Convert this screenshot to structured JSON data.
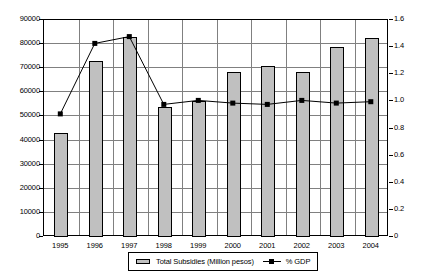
{
  "chart_data": {
    "type": "bar",
    "title": "",
    "subtitle": "",
    "xlabel": "",
    "ylabel": "",
    "categories": [
      "1995",
      "1996",
      "1997",
      "1998",
      "1999",
      "2000",
      "2001",
      "2002",
      "2003",
      "2004"
    ],
    "series": [
      {
        "name": "Total Subsidies (Million pesos)",
        "type": "bar",
        "axis": "left",
        "color": "#c0c0c0",
        "values": [
          43000,
          73000,
          83000,
          54000,
          56500,
          68500,
          71000,
          68500,
          79000,
          82500
        ]
      },
      {
        "name": "% GDP",
        "type": "line",
        "axis": "right",
        "color": "#000000",
        "values": [
          0.9,
          1.42,
          1.47,
          0.97,
          1.0,
          0.98,
          0.97,
          1.0,
          0.98,
          0.99
        ]
      }
    ],
    "left_axis": {
      "min": 0,
      "max": 90000,
      "step": 10000,
      "ticks": [
        "0",
        "10000",
        "20000",
        "30000",
        "40000",
        "50000",
        "60000",
        "70000",
        "80000",
        "90000"
      ]
    },
    "right_axis": {
      "min": 0,
      "max": 1.6,
      "step": 0.2,
      "ticks": [
        "0",
        "0.2",
        "0.4",
        "0.6",
        "0.8",
        "1.0",
        "1.2",
        "1.4",
        "1.6"
      ]
    },
    "grid": true,
    "legend_position": "bottom"
  },
  "legend": {
    "bar_label": "Total Subsidies (Million pesos)",
    "line_label": "% GDP"
  }
}
